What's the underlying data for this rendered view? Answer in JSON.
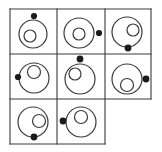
{
  "figure": {
    "canvas": {
      "width": 162,
      "height": 152
    },
    "background_color": "#ffffff",
    "stroke_color": "#3a3a3a",
    "dot_color": "#1a1a1a",
    "grid": {
      "columns": 3,
      "rows": 3,
      "x_lines": [
        10,
        57,
        105,
        151
      ],
      "y_lines": [
        9,
        54,
        99,
        144
      ],
      "line_width": 1.1,
      "missing_cells": [
        "row3-col3"
      ]
    },
    "cells": [
      {
        "id": "cell-r1c1",
        "row": 1,
        "col": 1,
        "big_circle": {
          "cx": 33,
          "cy": 34,
          "r": 14
        },
        "small_circle": {
          "cx": 30,
          "cy": 36,
          "r": 6
        },
        "dot": {
          "cx": 34,
          "cy": 16,
          "r": 3.1,
          "position": "top-outside"
        },
        "small_circle_position": "left-of-center",
        "label": "cell 1"
      },
      {
        "id": "cell-r1c2",
        "row": 1,
        "col": 2,
        "big_circle": {
          "cx": 79,
          "cy": 33,
          "r": 15
        },
        "small_circle": {
          "cx": 79,
          "cy": 34,
          "r": 6
        },
        "dot": {
          "cx": 99,
          "cy": 33,
          "r": 3.1,
          "position": "right-outside"
        },
        "small_circle_position": "center",
        "label": "cell 2"
      },
      {
        "id": "cell-r1c3",
        "row": 1,
        "col": 3,
        "big_circle": {
          "cx": 127,
          "cy": 32,
          "r": 15
        },
        "small_circle": {
          "cx": 133,
          "cy": 30,
          "r": 6
        },
        "dot": {
          "cx": 128,
          "cy": 48,
          "r": 3.4,
          "position": "bottom-on-edge"
        },
        "small_circle_position": "right-of-center",
        "label": "cell 3"
      },
      {
        "id": "cell-r2c1",
        "row": 2,
        "col": 1,
        "big_circle": {
          "cx": 34,
          "cy": 78,
          "r": 15
        },
        "small_circle": {
          "cx": 34,
          "cy": 72,
          "r": 6.5
        },
        "dot": {
          "cx": 18,
          "cy": 77,
          "r": 3.1,
          "position": "left-on-edge"
        },
        "small_circle_position": "above-center",
        "label": "cell 4"
      },
      {
        "id": "cell-r2c2",
        "row": 2,
        "col": 2,
        "big_circle": {
          "cx": 80,
          "cy": 79,
          "r": 15
        },
        "small_circle": {
          "cx": 75,
          "cy": 74,
          "r": 6
        },
        "dot": {
          "cx": 80,
          "cy": 59,
          "r": 3.4,
          "position": "top-on-edge"
        },
        "small_circle_position": "upper-left",
        "label": "cell 5"
      },
      {
        "id": "cell-r2c3",
        "row": 2,
        "col": 3,
        "big_circle": {
          "cx": 127,
          "cy": 79,
          "r": 15
        },
        "small_circle": {
          "cx": 127,
          "cy": 85,
          "r": 6.5
        },
        "dot": {
          "cx": 146,
          "cy": 79,
          "r": 3.4,
          "position": "right-outside"
        },
        "small_circle_position": "below-center",
        "label": "cell 6"
      },
      {
        "id": "cell-r3c1",
        "row": 3,
        "col": 1,
        "big_circle": {
          "cx": 33,
          "cy": 122,
          "r": 15
        },
        "small_circle": {
          "cx": 39,
          "cy": 121,
          "r": 6.5
        },
        "dot": {
          "cx": 34,
          "cy": 137,
          "r": 3.4,
          "position": "bottom-on-edge"
        },
        "small_circle_position": "right-of-center",
        "label": "cell 7"
      },
      {
        "id": "cell-r3c2",
        "row": 3,
        "col": 2,
        "big_circle": {
          "cx": 81,
          "cy": 122,
          "r": 15
        },
        "small_circle": {
          "cx": 81,
          "cy": 117,
          "r": 6.5
        },
        "dot": {
          "cx": 63,
          "cy": 121,
          "r": 3.4,
          "position": "left-outside"
        },
        "small_circle_position": "above-center",
        "label": "cell 8"
      }
    ]
  }
}
